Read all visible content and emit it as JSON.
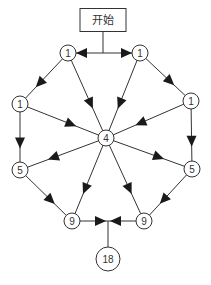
{
  "diagram": {
    "type": "directed-graph",
    "start": {
      "label": "开始",
      "x": 103,
      "y": 20,
      "w": 46,
      "h": 23
    },
    "junction_top": {
      "x": 103,
      "y": 53
    },
    "junction_bottom": {
      "x": 108,
      "y": 221
    },
    "nodes": [
      {
        "id": "top-left-1",
        "label": "1",
        "x": 68,
        "y": 53,
        "r": 8
      },
      {
        "id": "top-right-1",
        "label": "1",
        "x": 140,
        "y": 53,
        "r": 8
      },
      {
        "id": "left-1",
        "label": "1",
        "x": 20,
        "y": 104,
        "r": 8
      },
      {
        "id": "right-1",
        "label": "1",
        "x": 191,
        "y": 101,
        "r": 8
      },
      {
        "id": "center-4",
        "label": "4",
        "x": 106,
        "y": 138,
        "r": 8
      },
      {
        "id": "left-5",
        "label": "5",
        "x": 20,
        "y": 170,
        "r": 8
      },
      {
        "id": "right-5",
        "label": "5",
        "x": 192,
        "y": 169,
        "r": 8
      },
      {
        "id": "bottom-left-9",
        "label": "9",
        "x": 72,
        "y": 221,
        "r": 8
      },
      {
        "id": "bottom-right-9",
        "label": "9",
        "x": 144,
        "y": 221,
        "r": 8
      },
      {
        "id": "result-18",
        "label": "18",
        "x": 108,
        "y": 259,
        "r": 12
      }
    ],
    "edges": [
      {
        "from": "start",
        "to": "top-left-1"
      },
      {
        "from": "start",
        "to": "top-right-1"
      },
      {
        "from": "top-left-1",
        "to": "left-1"
      },
      {
        "from": "top-left-1",
        "to": "center-4"
      },
      {
        "from": "top-right-1",
        "to": "center-4"
      },
      {
        "from": "top-right-1",
        "to": "right-1"
      },
      {
        "from": "left-1",
        "to": "center-4"
      },
      {
        "from": "right-1",
        "to": "center-4"
      },
      {
        "from": "left-1",
        "to": "left-5"
      },
      {
        "from": "right-1",
        "to": "right-5"
      },
      {
        "from": "center-4",
        "to": "left-5"
      },
      {
        "from": "center-4",
        "to": "right-5"
      },
      {
        "from": "center-4",
        "to": "bottom-left-9"
      },
      {
        "from": "center-4",
        "to": "bottom-right-9"
      },
      {
        "from": "left-5",
        "to": "bottom-left-9"
      },
      {
        "from": "right-5",
        "to": "bottom-right-9"
      },
      {
        "from": "bottom-left-9",
        "to": "result-18"
      },
      {
        "from": "bottom-right-9",
        "to": "result-18"
      }
    ],
    "colors": {
      "stroke": "#333333",
      "fill": "#ffffff",
      "arrow": "#1a1a1a"
    }
  }
}
